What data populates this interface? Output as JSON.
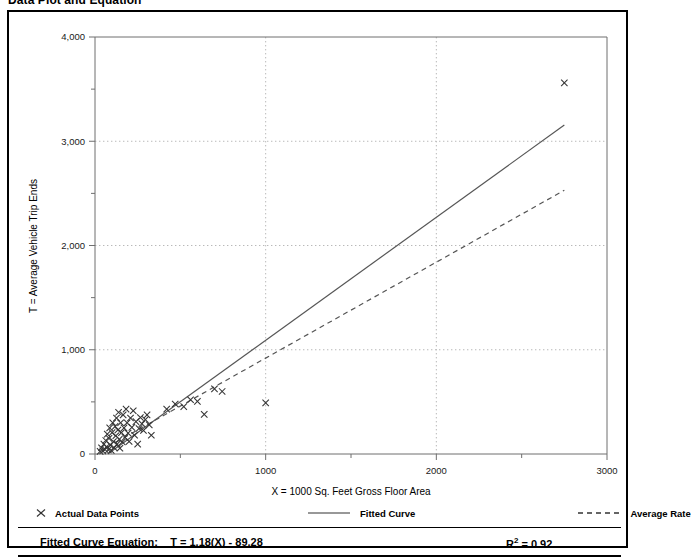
{
  "title": "Data Plot and Equation",
  "legend": {
    "items": [
      {
        "label": "Actual Data Points",
        "style": "marker-x",
        "icon": "x-marker-icon"
      },
      {
        "label": "Fitted Curve",
        "style": "solid-line",
        "icon": "solid-line-icon"
      },
      {
        "label": "Average Rate",
        "style": "dashed-line",
        "icon": "dashed-line-icon"
      }
    ]
  },
  "footer": {
    "equation_label": "Fitted Curve Equation:",
    "equation": "T = 1.18(X) - 89.28",
    "r_squared_label": "R",
    "r_squared_exponent": "2",
    "r_squared_value": "= 0.92"
  },
  "chart_data": {
    "type": "scatter",
    "title": "Data Plot and Equation",
    "xlabel": "X = 1000 Sq. Feet Gross Floor Area",
    "ylabel": "T = Average Vehicle Trip Ends",
    "xlim": [
      0,
      3000
    ],
    "ylim": [
      0,
      4000
    ],
    "xticks": [
      0,
      1000,
      2000,
      3000
    ],
    "xtick_labels": [
      "0",
      "1000",
      "2000",
      "3000"
    ],
    "yticks": [
      0,
      1000,
      2000,
      3000,
      4000
    ],
    "ytick_labels": [
      "0",
      "1,000",
      "2,000",
      "3,000",
      "4,000"
    ],
    "x_minor_tick_interval": 500,
    "y_minor_tick_interval": 500,
    "grid": "major-dotted",
    "legend_position": "below-plot",
    "series": [
      {
        "name": "Actual Data Points",
        "type": "scatter",
        "marker": "x",
        "color": "#333333",
        "points": [
          [
            30,
            25
          ],
          [
            38,
            60
          ],
          [
            45,
            30
          ],
          [
            52,
            95
          ],
          [
            58,
            45
          ],
          [
            63,
            130
          ],
          [
            68,
            70
          ],
          [
            72,
            190
          ],
          [
            78,
            40
          ],
          [
            82,
            150
          ],
          [
            86,
            250
          ],
          [
            90,
            85
          ],
          [
            95,
            35
          ],
          [
            100,
            205
          ],
          [
            104,
            300
          ],
          [
            108,
            120
          ],
          [
            112,
            60
          ],
          [
            118,
            265
          ],
          [
            122,
            175
          ],
          [
            126,
            345
          ],
          [
            130,
            95
          ],
          [
            134,
            230
          ],
          [
            138,
            400
          ],
          [
            142,
            140
          ],
          [
            146,
            55
          ],
          [
            150,
            300
          ],
          [
            155,
            205
          ],
          [
            160,
            115
          ],
          [
            165,
            375
          ],
          [
            170,
            250
          ],
          [
            176,
            160
          ],
          [
            182,
            430
          ],
          [
            188,
            300
          ],
          [
            194,
            200
          ],
          [
            200,
            120
          ],
          [
            208,
            345
          ],
          [
            216,
            255
          ],
          [
            224,
            415
          ],
          [
            232,
            180
          ],
          [
            240,
            310
          ],
          [
            250,
            95
          ],
          [
            258,
            245
          ],
          [
            266,
            350
          ],
          [
            275,
            290
          ],
          [
            284,
            225
          ],
          [
            295,
            330
          ],
          [
            305,
            375
          ],
          [
            318,
            280
          ],
          [
            330,
            180
          ],
          [
            420,
            430
          ],
          [
            470,
            480
          ],
          [
            520,
            455
          ],
          [
            560,
            520
          ],
          [
            600,
            505
          ],
          [
            640,
            380
          ],
          [
            700,
            625
          ],
          [
            745,
            600
          ],
          [
            1000,
            490
          ],
          [
            2750,
            3560
          ]
        ]
      },
      {
        "name": "Fitted Curve",
        "type": "line",
        "style": "solid",
        "color": "#555555",
        "slope": 1.18,
        "intercept": -89.28,
        "x_range": [
          75,
          2750
        ]
      },
      {
        "name": "Average Rate",
        "type": "line",
        "style": "dashed",
        "color": "#555555",
        "slope": 0.92,
        "intercept": 0,
        "x_range": [
          75,
          2750
        ]
      }
    ]
  }
}
